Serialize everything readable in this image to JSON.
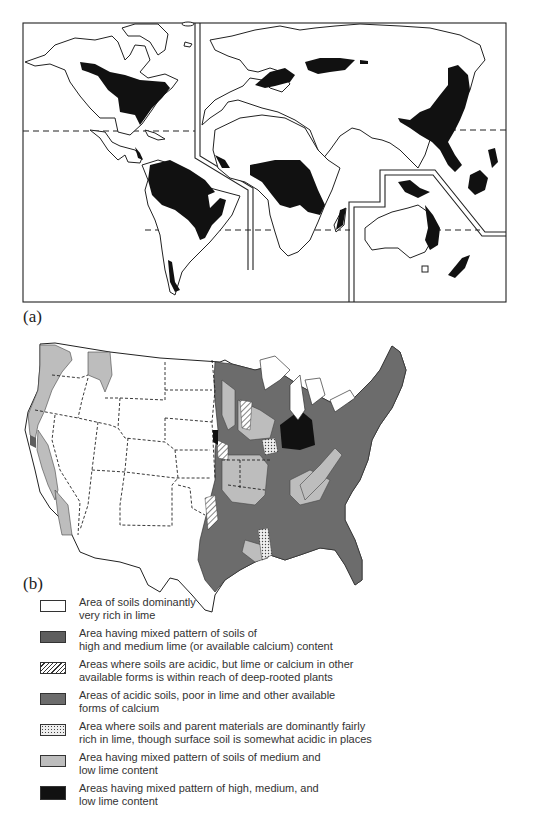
{
  "figure": {
    "panel_a_label": "(a)",
    "panel_b_label": "(b)"
  },
  "map_a": {
    "description": "World map showing black shaded regions (acidic, humid soils) in eastern North America, Amazon basin/Brazil, southern Chile, western/central Europe, Russia, central Africa, Madagascar, eastern China/Southeast Asia, Indonesia, New Guinea, eastern Australia, New Zealand",
    "fill_color": "#111111"
  },
  "map_b": {
    "description": "Contiguous United States soil lime content map"
  },
  "legend": {
    "items": [
      {
        "pattern": "white",
        "line1": "Area of soils dominantly",
        "line2": "very rich in lime"
      },
      {
        "pattern": "dark-gray",
        "line1": "Area having mixed pattern of soils of",
        "line2": "high and medium lime (or available calcium) content"
      },
      {
        "pattern": "hatched",
        "line1": "Areas where soils are acidic, but lime or calcium in other",
        "line2": "available forms is within reach of deep-rooted plants"
      },
      {
        "pattern": "medium-dark-gray",
        "line1": "Areas of acidic soils, poor in lime and other available",
        "line2": "forms of calcium"
      },
      {
        "pattern": "dotted",
        "line1": "Area where soils and parent materials are dominantly fairly",
        "line2": "rich in lime, though surface soil is somewhat acidic in places"
      },
      {
        "pattern": "light-gray",
        "line1": "Area having mixed pattern of soils of medium and",
        "line2": "low lime content"
      },
      {
        "pattern": "black",
        "line1": "Areas having mixed pattern of high, medium, and",
        "line2": "low lime content"
      }
    ]
  },
  "colors": {
    "white": "#ffffff",
    "dark_gray": "#5e5e5e",
    "medium_dark_gray": "#6c6c6c",
    "light_gray": "#bdbdbd",
    "black": "#111111"
  }
}
